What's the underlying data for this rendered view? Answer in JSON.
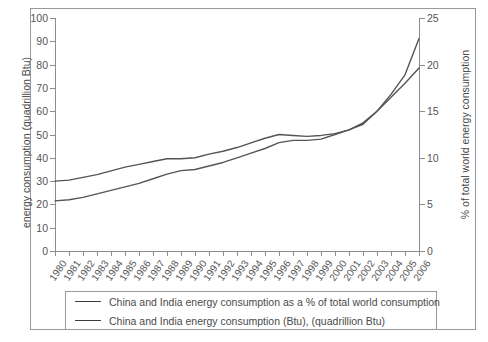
{
  "chart_data": {
    "type": "line",
    "title": "",
    "xlabel": "",
    "ylabel": "energy consumption (quadrillion Btu)",
    "y2label": "% of total world energy consumption",
    "grid": false,
    "legend_position": "bottom",
    "ylim": [
      0,
      100
    ],
    "y2lim": [
      0,
      25
    ],
    "yticks": [
      0,
      10,
      20,
      30,
      40,
      50,
      60,
      70,
      80,
      90,
      100
    ],
    "y2ticks": [
      0,
      5,
      10,
      15,
      20,
      25
    ],
    "categories": [
      "1980",
      "1981",
      "1982",
      "1983",
      "1984",
      "1985",
      "1986",
      "1987",
      "1988",
      "1989",
      "1990",
      "1991",
      "1992",
      "1993",
      "1994",
      "1995",
      "1996",
      "1997",
      "1998",
      "1999",
      "2000",
      "2001",
      "2002",
      "2003",
      "2004",
      "2005",
      "2006"
    ],
    "series": [
      {
        "name": "China and India energy consumption as a % of total world consumption",
        "axis": "right",
        "unit": "%",
        "values": [
          7.5,
          7.6,
          7.9,
          8.2,
          8.6,
          9.0,
          9.3,
          9.6,
          9.9,
          9.9,
          10.0,
          10.4,
          10.7,
          11.1,
          11.6,
          12.1,
          12.5,
          12.4,
          12.3,
          12.4,
          12.6,
          13.0,
          13.6,
          15.0,
          16.8,
          18.9,
          22.8
        ],
        "values_left_scale_equivalent": [
          30.0,
          30.4,
          31.6,
          32.8,
          34.4,
          36.0,
          37.2,
          38.4,
          39.6,
          39.6,
          40.0,
          41.6,
          42.8,
          44.4,
          46.4,
          48.4,
          50.0,
          49.6,
          49.2,
          49.6,
          50.4,
          52.0,
          54.4,
          60.0,
          67.2,
          75.6,
          91.2
        ]
      },
      {
        "name": "China and India energy consumption (Btu), (quadrillion Btu)",
        "axis": "left",
        "unit": "quadrillion Btu",
        "values": [
          21.5,
          22.0,
          23.0,
          24.5,
          26.0,
          27.5,
          29.0,
          31.0,
          33.0,
          34.5,
          35.0,
          36.5,
          38.0,
          40.0,
          42.0,
          44.0,
          46.5,
          47.5,
          47.5,
          48.0,
          50.0,
          52.0,
          55.0,
          60.0,
          66.0,
          72.0,
          78.5
        ]
      }
    ]
  },
  "legend": {
    "items": [
      {
        "label": "China and India energy consumption as a % of total world consumption",
        "color": "#3c3c3c"
      },
      {
        "label": "China and India energy consumption (Btu), (quadrillion Btu)",
        "color": "#3c3c3c"
      }
    ]
  },
  "colors": {
    "line": "#555555",
    "axis": "#8d8d8d",
    "frame": "#9a9a9a",
    "text": "#4a4a4a",
    "background": "#ffffff"
  }
}
